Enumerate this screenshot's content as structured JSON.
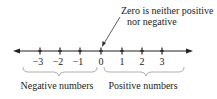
{
  "diagram": {
    "type": "number-line",
    "annotation": {
      "line1": "Zero is neither positive",
      "line2": "nor negative"
    },
    "ticks": [
      {
        "label": "−3",
        "value": -3
      },
      {
        "label": "−2",
        "value": -2
      },
      {
        "label": "−1",
        "value": -1
      },
      {
        "label": "0",
        "value": 0
      },
      {
        "label": "1",
        "value": 1
      },
      {
        "label": "2",
        "value": 2
      },
      {
        "label": "3",
        "value": 3
      }
    ],
    "groups": {
      "negative": "Negative numbers",
      "positive": "Positive numbers"
    },
    "colors": {
      "line": "#222222",
      "brace": "#999999"
    }
  }
}
